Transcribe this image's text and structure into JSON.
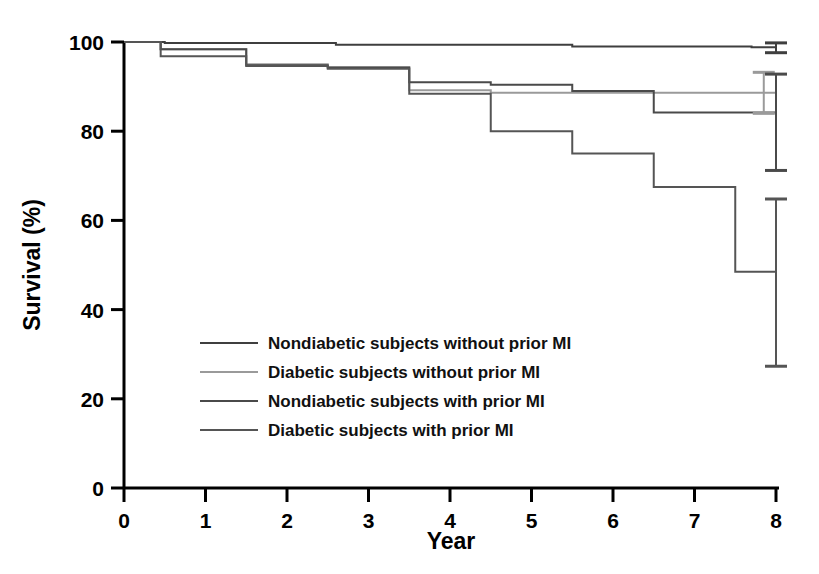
{
  "chart_data": {
    "type": "line",
    "subtype": "kaplan-meier-step",
    "title": "",
    "xlabel": "Year",
    "ylabel": "Survival (%)",
    "xlim": [
      0,
      8
    ],
    "ylim": [
      0,
      100
    ],
    "xticks": [
      0,
      1,
      2,
      3,
      4,
      5,
      6,
      7,
      8
    ],
    "xtick_labels": [
      "0",
      "1",
      "2",
      "3",
      "4",
      "5",
      "6",
      "7",
      "8"
    ],
    "yticks": [
      0,
      20,
      40,
      60,
      80,
      100
    ],
    "ytick_labels": [
      "0",
      "20",
      "40",
      "60",
      "80",
      "100"
    ],
    "grid": false,
    "legend_position": "center-left-inside",
    "series": [
      {
        "name": "Nondiabetic subjects without prior MI",
        "color": "#3f3f3f",
        "line_width": 2.0,
        "steps": [
          {
            "x": 0.0,
            "y": 100.0
          },
          {
            "x": 0.5,
            "y": 99.8
          },
          {
            "x": 2.6,
            "y": 99.4
          },
          {
            "x": 5.5,
            "y": 99.0
          },
          {
            "x": 7.7,
            "y": 98.8
          },
          {
            "x": 8.0,
            "y": 98.8
          }
        ],
        "error_bar": {
          "x": 8.0,
          "value": 98.8,
          "lower": 97.6,
          "upper": 99.8
        }
      },
      {
        "name": "Diabetic subjects without prior MI",
        "color": "#9a9a9a",
        "line_width": 2.0,
        "steps": [
          {
            "x": 0.0,
            "y": 100.0
          },
          {
            "x": 0.45,
            "y": 98.4
          },
          {
            "x": 1.5,
            "y": 95.0
          },
          {
            "x": 2.5,
            "y": 94.4
          },
          {
            "x": 3.5,
            "y": 89.2
          },
          {
            "x": 4.5,
            "y": 88.6
          },
          {
            "x": 5.5,
            "y": 88.6
          },
          {
            "x": 8.0,
            "y": 88.6
          }
        ],
        "error_bar": {
          "x": 7.85,
          "value": 88.6,
          "lower": 84.0,
          "upper": 93.2
        }
      },
      {
        "name": "Nondiabetic subjects with prior MI",
        "color": "#4a4a4a",
        "line_width": 2.0,
        "steps": [
          {
            "x": 0.0,
            "y": 100.0
          },
          {
            "x": 0.45,
            "y": 98.4
          },
          {
            "x": 1.5,
            "y": 94.8
          },
          {
            "x": 2.5,
            "y": 94.2
          },
          {
            "x": 3.5,
            "y": 91.0
          },
          {
            "x": 4.5,
            "y": 90.4
          },
          {
            "x": 5.5,
            "y": 89.0
          },
          {
            "x": 6.5,
            "y": 84.2
          },
          {
            "x": 8.0,
            "y": 83.6
          }
        ],
        "error_bar": {
          "x": 8.0,
          "value": 83.6,
          "lower": 71.2,
          "upper": 92.8
        }
      },
      {
        "name": "Diabetic subjects with prior MI",
        "color": "#555555",
        "line_width": 2.0,
        "steps": [
          {
            "x": 0.0,
            "y": 100.0
          },
          {
            "x": 0.45,
            "y": 96.8
          },
          {
            "x": 1.5,
            "y": 94.6
          },
          {
            "x": 2.5,
            "y": 94.0
          },
          {
            "x": 3.5,
            "y": 88.4
          },
          {
            "x": 4.5,
            "y": 80.0
          },
          {
            "x": 5.5,
            "y": 75.0
          },
          {
            "x": 6.5,
            "y": 67.5
          },
          {
            "x": 7.5,
            "y": 48.5
          },
          {
            "x": 8.0,
            "y": 48.5
          }
        ],
        "error_bar": {
          "x": 8.0,
          "value": 48.5,
          "lower": 27.3,
          "upper": 64.8
        }
      }
    ],
    "legend": [
      "Nondiabetic subjects without prior MI",
      "Diabetic subjects without prior MI",
      "Nondiabetic subjects with prior MI",
      "Diabetic subjects with prior MI"
    ]
  },
  "colors": {
    "axis": "#000000",
    "background": "#ffffff",
    "series_dark": "#3f3f3f",
    "series_light": "#9a9a9a"
  }
}
